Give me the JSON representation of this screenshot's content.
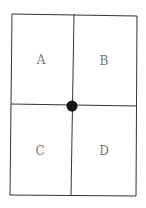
{
  "diagram": {
    "type": "quadrant-grid",
    "quadrants": [
      {
        "label": "A",
        "position": "top-left"
      },
      {
        "label": "B",
        "position": "top-right"
      },
      {
        "label": "C",
        "position": "bottom-left"
      },
      {
        "label": "D",
        "position": "bottom-right"
      }
    ],
    "center_marker": "filled-circle",
    "colors": {
      "line": "#333333",
      "label": "#777777",
      "dot": "#111111"
    }
  }
}
